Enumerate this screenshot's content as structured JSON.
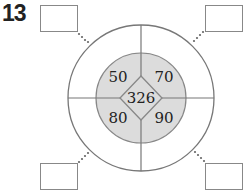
{
  "problem": {
    "number": "13"
  },
  "diagram": {
    "center_value": "326",
    "quadrants": {
      "top_left": "50",
      "top_right": "70",
      "bottom_left": "80",
      "bottom_right": "90"
    },
    "answer_boxes": {
      "top_left": "",
      "top_right": "",
      "bottom_left": "",
      "bottom_right": ""
    },
    "colors": {
      "inner_fill": "#dcdcdc",
      "line": "#777777",
      "box_border": "#888888"
    }
  }
}
